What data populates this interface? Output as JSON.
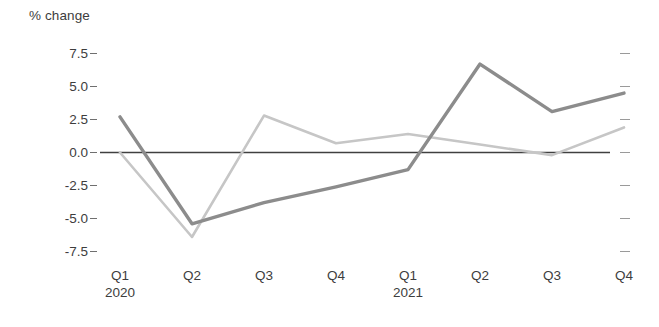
{
  "chart_data": {
    "type": "line",
    "title": "% change",
    "xlabel": "",
    "ylabel": "% change",
    "categories": [
      "Q1",
      "Q2",
      "Q3",
      "Q4",
      "Q1",
      "Q2",
      "Q3",
      "Q4"
    ],
    "category_group_labels": [
      {
        "index": 0,
        "label": "2020"
      },
      {
        "index": 4,
        "label": "2021"
      }
    ],
    "ylim": [
      -7.5,
      7.5
    ],
    "ytick_labels": [
      "7.5",
      "5.0",
      "2.5",
      "0.0",
      "-2.5",
      "-5.0",
      "-7.5"
    ],
    "ytick_values": [
      7.5,
      5.0,
      2.5,
      0.0,
      -2.5,
      -5.0,
      -7.5
    ],
    "grid": false,
    "legend": "none",
    "zero_line": true,
    "right_axis_ticks": 7,
    "series": [
      {
        "name": "series-dark",
        "color": "#8c8c8c",
        "width": 3.4,
        "values": [
          2.7,
          -5.4,
          -3.8,
          -2.6,
          -1.3,
          6.7,
          3.1,
          4.5
        ]
      },
      {
        "name": "series-light",
        "color": "#c6c6c6",
        "width": 2.6,
        "values": [
          0.0,
          -6.4,
          2.8,
          0.7,
          1.4,
          0.6,
          -0.2,
          1.9
        ]
      }
    ]
  },
  "axis": {
    "title": "% change",
    "tick_0": "7.5",
    "tick_1": "5.0",
    "tick_2": "2.5",
    "tick_3": "0.0",
    "tick_4": "-2.5",
    "tick_5": "-5.0",
    "tick_6": "-7.5"
  },
  "xaxis": {
    "t0": "Q1",
    "t1": "Q2",
    "t2": "Q3",
    "t3": "Q4",
    "t4": "Q1",
    "t5": "Q2",
    "t6": "Q3",
    "t7": "Q4",
    "year_2020": "2020",
    "year_2021": "2021"
  },
  "colors": {
    "series_dark": "#8c8c8c",
    "series_light": "#c6c6c6",
    "zero_line": "#404040",
    "text": "#3d3d3d",
    "background": "#ffffff"
  }
}
